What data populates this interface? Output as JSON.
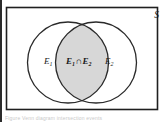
{
  "figure": {
    "type": "venn-diagram",
    "universe_label": "S",
    "set1_label_base": "E",
    "set1_label_sub": "1",
    "set2_label_base": "E",
    "set2_label_sub": "2",
    "intersection": {
      "left_base": "E",
      "left_sub": "1",
      "operator": "∩",
      "right_base": "E",
      "right_sub": "2"
    },
    "caption_partial": "Figure   Venn diagram   intersection   events",
    "colors": {
      "background": "#ffffff",
      "stroke": "#2a2a2a",
      "rectangle_stroke": "#1f1f1f",
      "intersection_fill": "#d7d7d7",
      "text": "#1a1a1a",
      "page_edge": "#2b2b2b"
    },
    "geometry": {
      "rect": {
        "x": 6,
        "y": 7,
        "width": 152,
        "height": 103
      },
      "circle1": {
        "cx": 68,
        "cy": 62.5,
        "r": 40.5
      },
      "circle2": {
        "cx": 96,
        "cy": 62.5,
        "r": 40.5
      }
    }
  }
}
